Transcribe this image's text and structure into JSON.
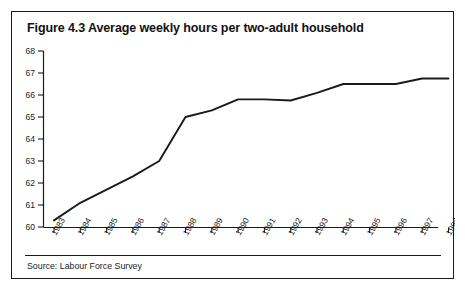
{
  "figure": {
    "title": "Figure 4.3 Average weekly hours per two-adult household",
    "source": "Source: Labour Force Survey"
  },
  "chart_data": {
    "type": "line",
    "title": "Figure 4.3 Average weekly hours per two-adult household",
    "subtitle": "",
    "xlabel": "",
    "ylabel": "",
    "categories": [
      "1983",
      "1984",
      "1985",
      "1986",
      "1987",
      "1988",
      "1989",
      "1990",
      "1991",
      "1992",
      "1993",
      "1994",
      "1995",
      "1996",
      "1997",
      "1998"
    ],
    "series": [
      {
        "name": "Average weekly hours per two-adult household",
        "values": [
          60.3,
          61.1,
          61.7,
          62.3,
          63.0,
          65.0,
          65.3,
          65.8,
          65.8,
          65.75,
          66.1,
          66.5,
          66.5,
          66.5,
          66.75,
          66.75
        ]
      }
    ],
    "ylim": [
      60,
      68
    ],
    "ytick_labels": [
      "60",
      "61",
      "62",
      "63",
      "64",
      "65",
      "66",
      "67",
      "68"
    ],
    "ytick_values": [
      60,
      61,
      62,
      63,
      64,
      65,
      66,
      67,
      68
    ],
    "xtick_labels": [
      "1983",
      "1984",
      "1985",
      "1986",
      "1987",
      "1988",
      "1989",
      "1990",
      "1991",
      "1992",
      "1993",
      "1994",
      "1995",
      "1996",
      "1997",
      "1998"
    ],
    "grid": false,
    "legend": false,
    "legend_position": "none",
    "line_color": "#1a1a1a",
    "axis_color": "#1a1a1a",
    "background_color": "#ffffff"
  }
}
